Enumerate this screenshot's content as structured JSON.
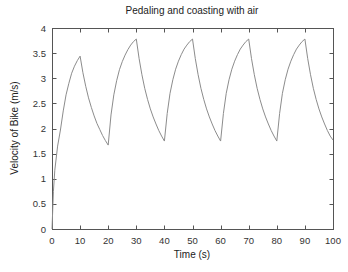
{
  "chart_data": {
    "type": "line",
    "title": "Pedaling and coasting with air",
    "xlabel": "Time (s)",
    "ylabel": "Velocity of Bike (m/s)",
    "xlim": [
      0,
      100
    ],
    "ylim": [
      0,
      4
    ],
    "xticks": [
      0,
      10,
      20,
      30,
      40,
      50,
      60,
      70,
      80,
      90,
      100
    ],
    "xtick_labels": [
      "0",
      "10",
      "20",
      "30",
      "40",
      "50",
      "60",
      "70",
      "80",
      "90",
      "100"
    ],
    "yticks": [
      0,
      0.5,
      1,
      1.5,
      2,
      2.5,
      3,
      3.5,
      4
    ],
    "ytick_labels": [
      "0",
      "0.5",
      "1",
      "1.5",
      "2",
      "2.5",
      "3",
      "3.5",
      "4"
    ],
    "grid": false,
    "legend": "none",
    "line_color": "#8c8c8c",
    "frame_color": "#555555",
    "series": [
      {
        "name": "velocity",
        "x": [
          0,
          0.5,
          1,
          2,
          3,
          4,
          5,
          6,
          7,
          8,
          9,
          10,
          11,
          12,
          13,
          14,
          15,
          16,
          17,
          18,
          19,
          20,
          21,
          22,
          23,
          24,
          25,
          26,
          27,
          28,
          29,
          30,
          31,
          32,
          33,
          34,
          35,
          36,
          37,
          38,
          39,
          40,
          41,
          42,
          43,
          44,
          45,
          46,
          47,
          48,
          49,
          50,
          51,
          52,
          53,
          54,
          55,
          56,
          57,
          58,
          59,
          60,
          61,
          62,
          63,
          64,
          65,
          66,
          67,
          68,
          69,
          70,
          71,
          72,
          73,
          74,
          75,
          76,
          77,
          78,
          79,
          80,
          81,
          82,
          83,
          84,
          85,
          86,
          87,
          88,
          89,
          90,
          91,
          92,
          93,
          94,
          95,
          96,
          97,
          98,
          99,
          100
        ],
        "values": [
          0,
          0.75,
          1.17,
          1.65,
          1.97,
          2.35,
          2.67,
          2.9,
          3.1,
          3.24,
          3.35,
          3.44,
          3.11,
          2.84,
          2.61,
          2.42,
          2.25,
          2.1,
          1.98,
          1.86,
          1.76,
          1.67,
          2.27,
          2.67,
          2.95,
          3.17,
          3.33,
          3.46,
          3.57,
          3.66,
          3.73,
          3.78,
          3.39,
          3.07,
          2.8,
          2.58,
          2.39,
          2.23,
          2.09,
          1.96,
          1.85,
          1.75,
          2.3,
          2.7,
          2.97,
          3.18,
          3.34,
          3.47,
          3.58,
          3.66,
          3.73,
          3.78,
          3.39,
          3.07,
          2.8,
          2.58,
          2.39,
          2.23,
          2.09,
          1.96,
          1.85,
          1.75,
          2.3,
          2.7,
          2.97,
          3.18,
          3.34,
          3.47,
          3.58,
          3.66,
          3.73,
          3.78,
          3.39,
          3.07,
          2.8,
          2.58,
          2.39,
          2.23,
          2.09,
          1.96,
          1.85,
          1.75,
          2.3,
          2.7,
          2.97,
          3.18,
          3.34,
          3.47,
          3.58,
          3.66,
          3.73,
          3.78,
          3.39,
          3.07,
          2.8,
          2.58,
          2.39,
          2.23,
          2.09,
          1.96,
          1.85,
          1.77
        ]
      }
    ]
  }
}
